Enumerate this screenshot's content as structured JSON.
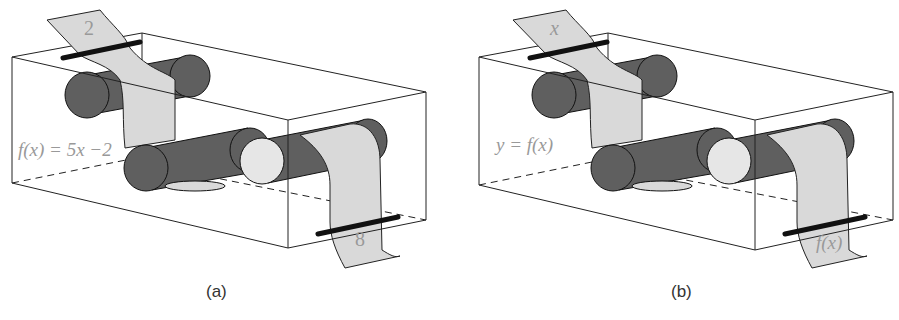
{
  "panels": [
    {
      "caption": "(a)",
      "function_label": "f(x) = 5x −2",
      "input_value": "2",
      "output_value": "8"
    },
    {
      "caption": "(b)",
      "function_label": "y = f(x)",
      "input_value": "x",
      "output_value": "f(x)"
    }
  ],
  "colors": {
    "roller": "#5f5f5f",
    "tape": "#d9d9d9",
    "light_roller_end": "#e6e6e6",
    "box_line": "#222222"
  }
}
